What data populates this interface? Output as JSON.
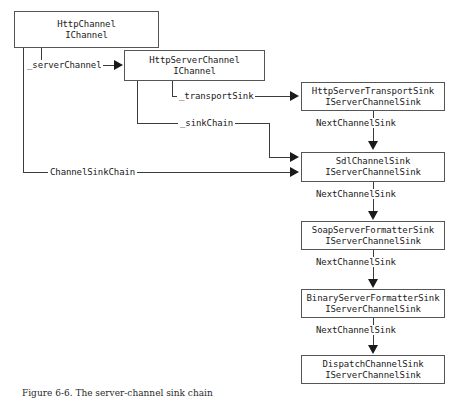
{
  "diagram": {
    "nodes": [
      {
        "id": "httpchannel",
        "class_name": "HttpChannel",
        "interface": "IChannel"
      },
      {
        "id": "httpserverchannel",
        "class_name": "HttpServerChannel",
        "interface": "IChannel"
      },
      {
        "id": "transportsink",
        "class_name": "HttpServerTransportSink",
        "interface": "IServerChannelSink"
      },
      {
        "id": "sdlchannelsink",
        "class_name": "SdlChannelSink",
        "interface": "IServerChannelSink"
      },
      {
        "id": "soapsink",
        "class_name": "SoapServerFormatterSink",
        "interface": "IServerChannelSink"
      },
      {
        "id": "binarysink",
        "class_name": "BinaryServerFormatterSink",
        "interface": "IServerChannelSink"
      },
      {
        "id": "dispatchsink",
        "class_name": "DispatchChannelSink",
        "interface": "IServerChannelSink"
      }
    ],
    "edges": [
      {
        "id": "server-channel",
        "label": "_serverChannel",
        "from": "httpchannel",
        "to": "httpserverchannel"
      },
      {
        "id": "transport-sink",
        "label": "_transportSink",
        "from": "httpserverchannel",
        "to": "transportsink"
      },
      {
        "id": "sink-chain",
        "label": "_sinkChain",
        "from": "httpserverchannel",
        "to": "sdlchannelsink"
      },
      {
        "id": "channel-sink-chain",
        "label": "ChannelSinkChain",
        "from": "httpchannel",
        "to": "sdlchannelsink"
      },
      {
        "id": "next-1",
        "label": "NextChannelSink",
        "from": "transportsink",
        "to": "sdlchannelsink"
      },
      {
        "id": "next-2",
        "label": "NextChannelSink",
        "from": "sdlchannelsink",
        "to": "soapsink"
      },
      {
        "id": "next-3",
        "label": "NextChannelSink",
        "from": "soapsink",
        "to": "binarysink"
      },
      {
        "id": "next-4",
        "label": "NextChannelSink",
        "from": "binarysink",
        "to": "dispatchsink"
      }
    ],
    "caption": "Figure 6-6. The server-channel sink chain",
    "colors": {
      "background": "#ffffff",
      "box_border": "#555555",
      "line": "#3b3b3b",
      "text": "#1a1a1a"
    }
  }
}
